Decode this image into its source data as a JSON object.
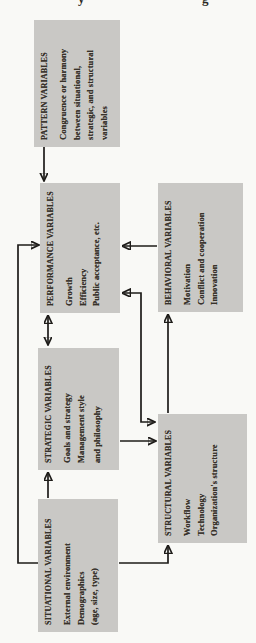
{
  "figure": {
    "kind": "scanned organization-theory flow diagram, rotated 90 degrees",
    "colors": {
      "box_fill": "#c9c8c5",
      "text": "#38322b",
      "arrow": "#1e1c19",
      "page_background": "#f9f9f6"
    },
    "nodes": {
      "situational": {
        "title": "SITUATIONAL VARIABLES",
        "lines": [
          "External environment",
          "Demographics",
          "(age, size, type)"
        ]
      },
      "strategic": {
        "title": "STRATEGIC VARIABLES",
        "lines": [
          "Goals and strategy",
          "Management style",
          "and philosophy"
        ]
      },
      "performance": {
        "title": "PERFORMANCE VARIABLES",
        "lines": [
          "Growth",
          "Efficiency",
          "Public acceptance, etc."
        ]
      },
      "pattern": {
        "title": "PATTERN VARIABLES",
        "lines": [
          "Congruence or harmony",
          "between situational,",
          "strategic, and structural",
          "variables"
        ]
      },
      "structural": {
        "title": "STRUCTURAL VARIABLES",
        "lines": [
          "Workflow",
          "Technology",
          "Organization's structure"
        ]
      },
      "behavioral": {
        "title": "BEHAVIORAL VARIABLES",
        "lines": [
          "Motivation",
          "Conflict and cooperation",
          "Innovation"
        ]
      }
    },
    "edges": [
      {
        "from": "situational",
        "to": "strategic",
        "two_way": false
      },
      {
        "from": "situational",
        "to": "structural",
        "two_way": false
      },
      {
        "from": "situational",
        "to": "performance",
        "two_way": false
      },
      {
        "from": "strategic",
        "to": "performance",
        "two_way": true
      },
      {
        "from": "strategic",
        "to": "structural",
        "two_way": false
      },
      {
        "from": "structural",
        "to": "performance",
        "two_way": true
      },
      {
        "from": "structural",
        "to": "behavioral",
        "two_way": false
      },
      {
        "from": "behavioral",
        "to": "performance",
        "two_way": false
      },
      {
        "from": "pattern",
        "to": "performance",
        "two_way": false
      }
    ],
    "artifacts": {
      "fragments": [
        "y",
        "g"
      ]
    }
  }
}
